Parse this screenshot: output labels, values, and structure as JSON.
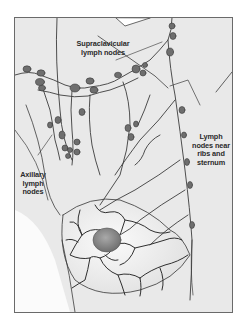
{
  "figure": {
    "type": "anatomical-illustration",
    "colors": {
      "background": "#e9e9e9",
      "skin_light": "#f4f4f4",
      "vessel": "#3c3c3c",
      "node_fill": "#6e6e6e",
      "frame_border": "#6a6a6a"
    }
  },
  "labels": {
    "supraclavicular": [
      "Supraclavicular",
      "lymph nodes"
    ],
    "ribs_sternum": [
      "Lymph",
      "nodes near",
      "ribs and",
      "sternum"
    ],
    "axillary": [
      "Axillary",
      "lymph",
      "nodes"
    ]
  }
}
